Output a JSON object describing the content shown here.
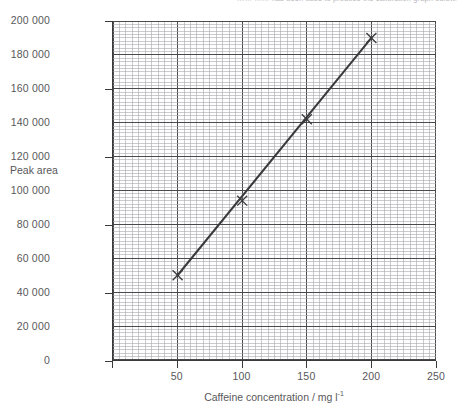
{
  "caption": {
    "text": "……  …… has been used to produce the calibration graph below."
  },
  "chart_data": {
    "type": "scatter",
    "title": "",
    "subtitle": "",
    "xlabel": "Caffeine concentration / mg l",
    "xlabel_sup": "-1",
    "ylabel": "Peak area",
    "xlim": [
      0,
      250
    ],
    "ylim": [
      0,
      200000
    ],
    "x_ticks": [
      0,
      50,
      100,
      150,
      200,
      250
    ],
    "x_tick_labels": [
      "",
      "50",
      "100",
      "150",
      "200",
      "250"
    ],
    "y_ticks": [
      0,
      20000,
      40000,
      60000,
      80000,
      100000,
      120000,
      140000,
      160000,
      180000,
      200000
    ],
    "y_tick_labels": [
      "0",
      "20 000",
      "40 000",
      "60 000",
      "80 000",
      "100 000",
      "120 000",
      "140 000",
      "160 000",
      "180 000",
      "200 000"
    ],
    "grid": "graph-paper",
    "grid_minor_x_step": 5,
    "grid_minor_y_step": 2000,
    "grid_major_x_step": 50,
    "grid_major_y_step": 20000,
    "legend": "none",
    "marker": "x-cross",
    "series": [
      {
        "name": "Caffeine calibration",
        "x": [
          50,
          100,
          150,
          200
        ],
        "y": [
          50000,
          94000,
          142000,
          190000
        ],
        "line": "best-fit-straight",
        "color": "#3a3a3c"
      }
    ],
    "annotations": []
  },
  "colors": {
    "axis": "#3a3a3c",
    "grid_minor": "#a9a9ae",
    "grid_major": "#4a4a4c",
    "text": "#58585a",
    "line": "#3a3a3c",
    "plot_background": "#fefefe"
  }
}
